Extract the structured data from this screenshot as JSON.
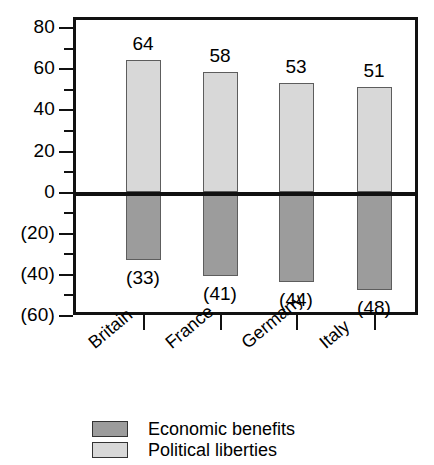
{
  "chart_data": {
    "type": "bar",
    "title": "",
    "subtitle": "",
    "xlabel": "",
    "ylabel": "",
    "categories": [
      "Britain",
      "France",
      "Germany",
      "Italy"
    ],
    "series": [
      {
        "name": "Political liberties",
        "color": "#d8d8d8",
        "values": [
          64,
          58,
          53,
          51
        ],
        "labels": [
          "64",
          "58",
          "53",
          "51"
        ]
      },
      {
        "name": "Economic benefits",
        "color": "#9c9c9c",
        "values": [
          -33,
          -41,
          -44,
          -48
        ],
        "labels": [
          "(33)",
          "(41)",
          "(44)",
          "(48)"
        ]
      }
    ],
    "ylim": [
      -60,
      85
    ],
    "ytick_values": [
      80,
      60,
      40,
      20,
      0,
      -20,
      -40,
      -60
    ],
    "ytick_labels": [
      "80",
      "60",
      "40",
      "20",
      "0",
      "(20)",
      "(40)",
      "(60)"
    ],
    "yminor_values": [
      70,
      50,
      30,
      10,
      -10,
      -30,
      -50
    ],
    "grid": false,
    "legend_position": "bottom"
  },
  "legend": {
    "items": [
      {
        "label": "Economic benefits",
        "color": "#9c9c9c"
      },
      {
        "label": "Political liberties",
        "color": "#d8d8d8"
      }
    ]
  },
  "colors": {
    "axis": "#111111",
    "bar_border": "#5d5d5d",
    "background": "#ffffff",
    "economic_benefits": "#9c9c9c",
    "political_liberties": "#d8d8d8"
  }
}
